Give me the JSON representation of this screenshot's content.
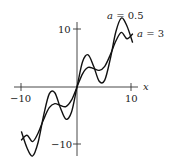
{
  "chart_data": {
    "type": "line",
    "title": "",
    "xlabel": "x",
    "ylabel": "",
    "xlim": [
      -10,
      10
    ],
    "ylim": [
      -12,
      12
    ],
    "grid": false,
    "legend": "inline labels near right end of curves",
    "x_ticks": [
      -10,
      10
    ],
    "x_tick_labels": [
      "−10",
      "10"
    ],
    "y_ticks": [
      10,
      -10
    ],
    "y_tick_labels": [
      "10",
      "−10"
    ],
    "series": [
      {
        "name": "a = 0.5",
        "label_var": "a",
        "label_val": "= 0.5",
        "x": [
          -10,
          -9,
          -8,
          -7,
          -6,
          -5,
          -4,
          -3,
          -2,
          -1,
          0,
          1,
          2,
          3,
          4,
          5,
          6,
          7,
          8,
          9,
          10
        ],
        "y": [
          -7.8,
          -10.6,
          -12.0,
          -9.6,
          -4.9,
          -1.2,
          -1.0,
          -3.6,
          -5.6,
          -4.4,
          0,
          4.4,
          5.6,
          3.6,
          1.0,
          1.2,
          4.9,
          9.6,
          12.0,
          10.6,
          7.8
        ]
      },
      {
        "name": "a = 3",
        "label_var": "a",
        "label_val": "= 3",
        "x": [
          -10,
          -9,
          -8,
          -7,
          -6,
          -5,
          -4,
          -3,
          -2,
          -1,
          0,
          1,
          2,
          3,
          4,
          5,
          6,
          7,
          8,
          9,
          10
        ],
        "y": [
          -9.2,
          -8.4,
          -9.5,
          -8.0,
          -5.6,
          -3.6,
          -2.9,
          -3.2,
          -3.4,
          -2.3,
          0,
          2.3,
          3.4,
          3.2,
          2.9,
          3.6,
          5.6,
          8.0,
          9.5,
          8.4,
          9.2
        ]
      }
    ]
  },
  "axes": {
    "x_label": "x",
    "x_min_label": "−10",
    "x_max_label": "10",
    "y_max_label": "10",
    "y_min_label": "−10"
  }
}
